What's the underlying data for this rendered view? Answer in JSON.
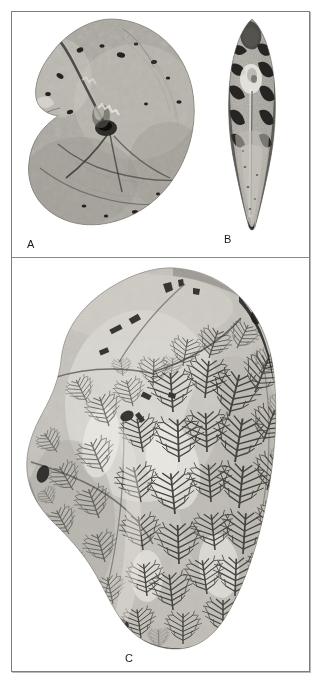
{
  "plate": {
    "background_color": "#ffffff",
    "frame_color": "#7d7d7d",
    "divider_color": "#8a8a8a",
    "width": 322,
    "height": 684
  },
  "labels": {
    "a": "A",
    "b": "B",
    "c": "C"
  },
  "specimens": [
    {
      "id": "a",
      "label": "A",
      "name": "ammonite-lateral-view",
      "description": "Coiled ammonite shell, lateral view, internal mould with cracked stone matrix",
      "tone_light": "#c9c6bf",
      "tone_mid": "#9d9a92",
      "tone_dark": "#4a4843"
    },
    {
      "id": "b",
      "label": "B",
      "name": "ammonite-ventral-view",
      "description": "Same ammonite, narrow lanceolate ventral view showing compressed keel",
      "tone_light": "#d2d0c9",
      "tone_mid": "#8e8b84",
      "tone_dark": "#1c1b19"
    },
    {
      "id": "c",
      "label": "C",
      "name": "ammonite-suture-detail",
      "description": "Large specimen fragment showing dendritic ammonitic suture lines across the shell surface",
      "tone_light": "#e4e2dc",
      "tone_mid": "#a6a39b",
      "tone_dark": "#2b2a27"
    }
  ]
}
